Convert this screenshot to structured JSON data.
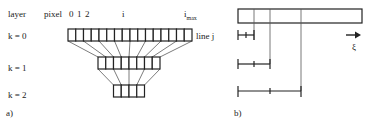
{
  "panel_a": {
    "label": "a)",
    "header": {
      "layer": "layer",
      "pixel": "pixel",
      "idx0": "0",
      "idx1": "1",
      "idx2": "2",
      "i": "i",
      "imax_base": "i",
      "imax_sub": "max"
    },
    "line_label": "line j",
    "layers": [
      {
        "label": "k = 0",
        "cells": 16
      },
      {
        "label": "k = 1",
        "cells": 8
      },
      {
        "label": "k = 2",
        "cells": 4
      }
    ]
  },
  "panel_b": {
    "label": "b)",
    "axis_symbol": "ξ",
    "brackets": [
      "scale k=0",
      "scale k=1",
      "scale k=2"
    ]
  }
}
